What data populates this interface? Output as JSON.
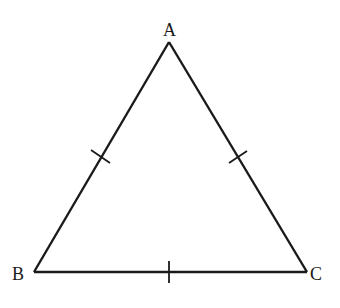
{
  "diagram": {
    "type": "equilateral-triangle",
    "stroke_color": "#1a1a1a",
    "background": "#ffffff",
    "vertices": [
      {
        "name": "A",
        "label": "A",
        "x": 169,
        "y": 42,
        "label_x": 163,
        "label_y": 21
      },
      {
        "name": "B",
        "label": "B",
        "x": 34,
        "y": 272,
        "label_x": 12,
        "label_y": 265
      },
      {
        "name": "C",
        "label": "C",
        "x": 307,
        "y": 272,
        "label_x": 310,
        "label_y": 265
      }
    ],
    "sides": [
      {
        "name": "AB",
        "tick_marks": 1
      },
      {
        "name": "AC",
        "tick_marks": 1
      },
      {
        "name": "BC",
        "tick_marks": 1
      }
    ]
  }
}
